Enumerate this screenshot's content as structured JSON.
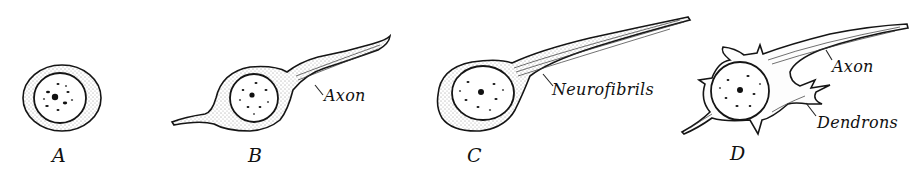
{
  "figure": {
    "panels": [
      {
        "id": "A",
        "letter": "A",
        "labels": []
      },
      {
        "id": "B",
        "letter": "B",
        "labels": [
          "Axon"
        ]
      },
      {
        "id": "C",
        "letter": "C",
        "labels": [
          "Neurofibrils"
        ]
      },
      {
        "id": "D",
        "letter": "D",
        "labels": [
          "Axon",
          "Dendrons"
        ]
      }
    ]
  },
  "labels": {
    "a_letter": "A",
    "b_letter": "B",
    "b_axon": "Axon",
    "c_letter": "C",
    "c_neurofibrils": "Neurofibrils",
    "d_letter": "D",
    "d_axon": "Axon",
    "d_dendrons": "Dendrons"
  }
}
